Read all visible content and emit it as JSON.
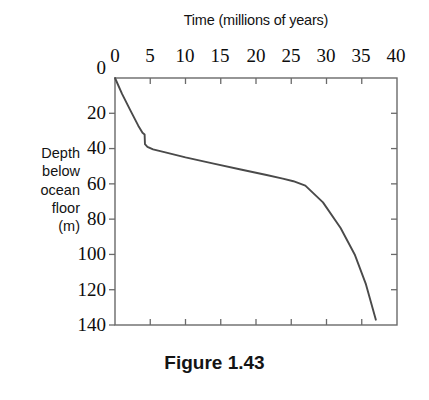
{
  "figure": {
    "caption": "Figure 1.43"
  },
  "chart_data": {
    "type": "line",
    "title": "",
    "xlabel": "Time (millions of years)",
    "ylabel": "Depth below ocean floor (m)",
    "ylabel_lines": [
      "Depth",
      "below",
      "ocean",
      "floor",
      "(m)"
    ],
    "xlim": [
      0,
      40
    ],
    "ylim": [
      0,
      140
    ],
    "y_inverted": true,
    "x_axis_position": "top",
    "grid": false,
    "legend": null,
    "xticks": [
      0,
      5,
      10,
      15,
      20,
      25,
      30,
      35,
      40
    ],
    "xtick_labels": [
      "0",
      "5",
      "10",
      "15",
      "20",
      "25",
      "30",
      "35",
      "40"
    ],
    "yticks": [
      0,
      20,
      40,
      60,
      80,
      100,
      120,
      140
    ],
    "ytick_labels": [
      "0",
      "20",
      "40",
      "60",
      "80",
      "100",
      "120",
      "140"
    ],
    "series": [
      {
        "name": "sediment accumulation",
        "x": [
          0.0,
          1.0,
          2.2,
          3.3,
          3.9,
          4.2,
          4.25,
          4.6,
          5.4,
          7.0,
          10.0,
          14.0,
          18.0,
          21.5,
          23.8,
          25.3,
          27.0,
          29.5,
          32.0,
          34.0,
          35.6,
          37.0
        ],
        "y": [
          0.0,
          9.0,
          18.5,
          27.0,
          31.0,
          32.0,
          37.5,
          39.0,
          40.5,
          42.0,
          45.0,
          48.5,
          52.0,
          55.0,
          57.0,
          58.5,
          61.0,
          70.5,
          85.0,
          100.0,
          117.0,
          137.0
        ]
      }
    ],
    "colors": {
      "line": "#4a4a4a",
      "axis": "#6a6a6a",
      "text": "#111111",
      "background": "#ffffff"
    },
    "plot_area_px": {
      "left": 115,
      "top": 78,
      "right": 397,
      "bottom": 325
    }
  }
}
